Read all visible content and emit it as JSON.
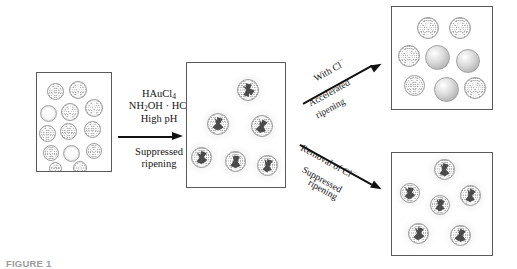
{
  "figure": {
    "caption": "FIGURE 1",
    "panels": {
      "seed": {
        "name": "seed-particles-panel",
        "textured_count": 11,
        "ring_count": 2,
        "particles": [
          {
            "type": "textured",
            "x": 10,
            "y": 10,
            "d": 17
          },
          {
            "type": "textured",
            "x": 32,
            "y": 8,
            "d": 18
          },
          {
            "type": "ring",
            "x": 3,
            "y": 32,
            "d": 17
          },
          {
            "type": "textured",
            "x": 24,
            "y": 30,
            "d": 18
          },
          {
            "type": "textured",
            "x": 48,
            "y": 26,
            "d": 18
          },
          {
            "type": "textured",
            "x": 2,
            "y": 52,
            "d": 17
          },
          {
            "type": "textured",
            "x": 23,
            "y": 50,
            "d": 17
          },
          {
            "type": "textured",
            "x": 47,
            "y": 48,
            "d": 17
          },
          {
            "type": "textured",
            "x": 6,
            "y": 72,
            "d": 16
          },
          {
            "type": "ring",
            "x": 26,
            "y": 72,
            "d": 17
          },
          {
            "type": "textured",
            "x": 49,
            "y": 70,
            "d": 16
          },
          {
            "type": "textured",
            "x": 36,
            "y": 88,
            "d": 14
          },
          {
            "type": "textured",
            "x": 12,
            "y": 89,
            "d": 13
          }
        ]
      },
      "spiked": {
        "name": "spiked-particles-panel",
        "particle_count": 6,
        "particles": [
          {
            "x": 50,
            "y": 16,
            "d": 22,
            "spikes": [
              15,
              125,
              200
            ]
          },
          {
            "x": 20,
            "y": 50,
            "d": 22,
            "spikes": [
              20,
              150,
              210
            ]
          },
          {
            "x": 64,
            "y": 52,
            "d": 22,
            "spikes": [
              30,
              165,
              215
            ]
          },
          {
            "x": 4,
            "y": 84,
            "d": 21,
            "spikes": [
              25,
              140,
              205
            ]
          },
          {
            "x": 38,
            "y": 88,
            "d": 21,
            "spikes": [
              12,
              155,
              200
            ]
          },
          {
            "x": 70,
            "y": 92,
            "d": 21,
            "spikes": [
              22,
              160,
              210
            ]
          }
        ]
      },
      "ripened": {
        "name": "accelerated-ripening-panel",
        "textured_count": 6,
        "smooth_count": 3,
        "particles": [
          {
            "type": "textured",
            "x": 25,
            "y": 10,
            "d": 22
          },
          {
            "type": "textured",
            "x": 57,
            "y": 10,
            "d": 22
          },
          {
            "type": "textured",
            "x": 6,
            "y": 38,
            "d": 22
          },
          {
            "type": "smooth",
            "x": 33,
            "y": 38,
            "d": 25
          },
          {
            "type": "smooth",
            "x": 64,
            "y": 42,
            "d": 24
          },
          {
            "type": "textured",
            "x": 12,
            "y": 68,
            "d": 21
          },
          {
            "type": "smooth",
            "x": 42,
            "y": 70,
            "d": 25
          },
          {
            "type": "textured",
            "x": 72,
            "y": 70,
            "d": 22
          }
        ]
      },
      "preserved": {
        "name": "suppressed-ripening-panel",
        "particle_count": 6,
        "particles": [
          {
            "x": 42,
            "y": 6,
            "d": 21,
            "spikes": [
              20,
              150,
              205
            ]
          },
          {
            "x": 8,
            "y": 30,
            "d": 20,
            "spikes": [
              15,
              140,
              210
            ]
          },
          {
            "x": 68,
            "y": 32,
            "d": 21,
            "spikes": [
              28,
              160,
              205
            ]
          },
          {
            "x": 38,
            "y": 42,
            "d": 20,
            "spikes": [
              18,
              155,
              200
            ]
          },
          {
            "x": 16,
            "y": 70,
            "d": 21,
            "spikes": [
              22,
              145,
              208
            ]
          },
          {
            "x": 58,
            "y": 72,
            "d": 21,
            "spikes": [
              25,
              158,
              212
            ]
          }
        ]
      }
    },
    "arrows": {
      "main": {
        "name": "main-reaction-arrow",
        "reagent_line_1": "HAuCl",
        "reagent_line_1_sub": "4",
        "reagent_line_2": "NH",
        "reagent_line_2_sub": "2",
        "reagent_line_2_rest": "OH · HCl",
        "reagent_line_3": "High pH",
        "below_line_1": "Suppressed",
        "below_line_2": "ripening"
      },
      "upper": {
        "name": "accelerated-ripening-arrow",
        "above_label": "With Cl",
        "above_label_sup": "−",
        "below_line_1": "Accelerated",
        "below_line_2": "ripening"
      },
      "lower": {
        "name": "suppressed-ripening-arrow",
        "above_label": "Removal of Cl",
        "above_label_sup": "−",
        "below_line_1": "Suppressed",
        "below_line_2": "ripening"
      }
    },
    "colors": {
      "panel_border": "#5a5a5a",
      "arrow": "#111111",
      "spike": "#4b4b4b",
      "particle_fill": "#cfcfcf",
      "text": "#141414"
    }
  }
}
